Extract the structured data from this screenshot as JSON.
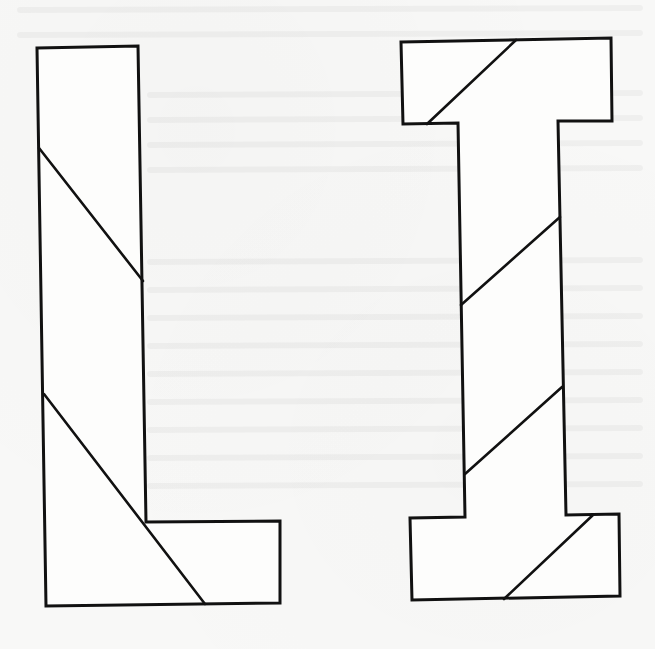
{
  "figure": {
    "colors": {
      "background": "#f8f8f7",
      "stroke": "#111111",
      "fill": "#fdfdfc"
    },
    "shapes": [
      {
        "name": "letter-L",
        "outline_points": "37,48 138,46 146,522 280,521 280,603 46,606",
        "cuts": [
          {
            "x1": 39,
            "y1": 148,
            "x2": 143,
            "y2": 281
          },
          {
            "x1": 44,
            "y1": 394,
            "x2": 205,
            "y2": 604
          }
        ]
      },
      {
        "name": "letter-I",
        "outline_points": "401,42 611,38 612,121 558,121 566,515 619,514 620,596 412,600 410,518 465,517 458,123 403,124",
        "cuts": [
          {
            "x1": 516,
            "y1": 40,
            "x2": 427,
            "y2": 124
          },
          {
            "x1": 560,
            "y1": 217,
            "x2": 461,
            "y2": 305
          },
          {
            "x1": 562,
            "y1": 387,
            "x2": 465,
            "y2": 474
          },
          {
            "x1": 593,
            "y1": 515,
            "x2": 504,
            "y2": 599
          }
        ]
      }
    ]
  }
}
